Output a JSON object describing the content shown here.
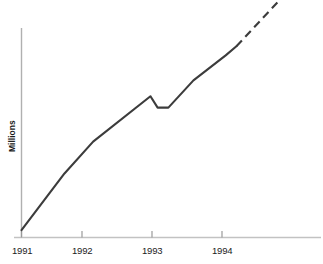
{
  "chart_data": {
    "type": "line",
    "title": "",
    "subtitle": "",
    "xlabel": "",
    "ylabel": "Millions",
    "grid": false,
    "legend": "none",
    "xlim": [
      1991,
      1994.65
    ],
    "ylim": [
      0,
      100
    ],
    "xticks": [
      "1991",
      "1992",
      "1993",
      "1994"
    ],
    "xtick_values": [
      1991,
      1992,
      1993,
      1994
    ],
    "yticks": [],
    "series": [
      {
        "name": "Actual",
        "style": "solid",
        "color": "#3c3c3c",
        "x": [
          1991.0,
          1991.6,
          1992.0,
          1992.8,
          1992.9,
          1993.05,
          1993.4,
          1993.85,
          1994.0
        ],
        "values": [
          3,
          28,
          42,
          62,
          57,
          57,
          69,
          80,
          84
        ]
      },
      {
        "name": "Projected",
        "style": "dashed",
        "color": "#3c3c3c",
        "x": [
          1994.0,
          1994.65
        ],
        "values": [
          84,
          106
        ]
      }
    ],
    "annotations": []
  },
  "axis": {
    "ylabel": "Millions",
    "xtick_labels": [
      "1991",
      "1992",
      "1993",
      "1994"
    ],
    "axis_color": "#b5b5b5",
    "line_color": "#3c3c3c"
  }
}
